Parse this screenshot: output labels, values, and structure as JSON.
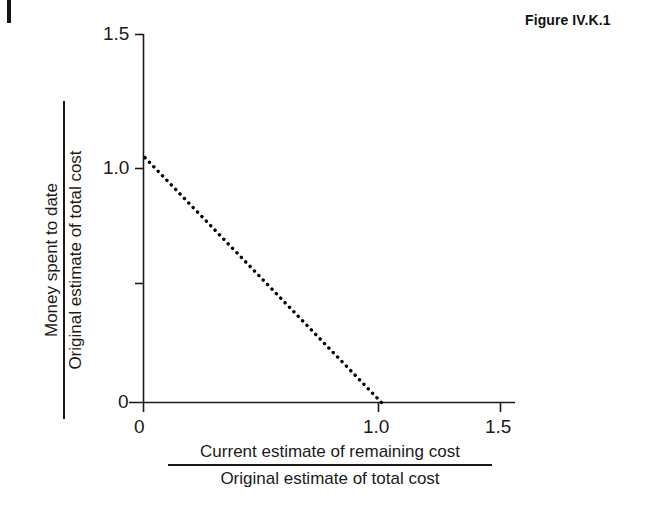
{
  "figure": {
    "caption": "Figure IV.K.1"
  },
  "chart_data": {
    "type": "line",
    "title": "Figure IV.K.1",
    "xlabel_numerator": "Current estimate of remaining cost",
    "xlabel_denominator": "Original estimate of total cost",
    "ylabel_numerator": "Money spent to date",
    "ylabel_denominator": "Original estimate of total cost",
    "xlim": [
      0,
      1.5
    ],
    "ylim": [
      0,
      1.5
    ],
    "x_ticks": [
      0,
      1.0,
      1.5
    ],
    "x_tick_labels": [
      "0",
      "1.0",
      "1.5"
    ],
    "y_ticks": [
      0,
      0.5,
      1.0,
      1.5
    ],
    "y_tick_labels": [
      "0",
      "",
      "1.0",
      "1.5"
    ],
    "grid": false,
    "legend": null,
    "series": [
      {
        "name": "budget constraint",
        "style": "dotted",
        "color": "#000000",
        "x": [
          0.0,
          1.0
        ],
        "y": [
          1.0,
          0.0
        ]
      }
    ],
    "annotations": []
  },
  "axes": {
    "y_tick_labels": {
      "t15": "1.5",
      "t10": "1.0",
      "t0": "0"
    },
    "x_tick_labels": {
      "t0": "0",
      "t10": "1.0",
      "t15": "1.5"
    },
    "ylabel": {
      "numerator": "Money spent to date",
      "denominator": "Original estimate of total cost"
    },
    "xlabel": {
      "numerator": "Current estimate of remaining cost",
      "denominator": "Original estimate of total cost"
    }
  }
}
